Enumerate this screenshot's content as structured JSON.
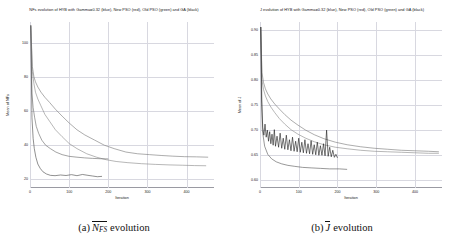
{
  "figure": {
    "panels": [
      {
        "id": "panel-nfs",
        "title": "NFs evolution of HYB with Gamma=0.32 (blue), New PSO (red), Old PSO (green) and GA (black)",
        "caption_lead": "(a)",
        "caption_symbol_main": "N",
        "caption_symbol_sub": "FS",
        "caption_tail": "evolution"
      },
      {
        "id": "panel-j",
        "title": "J evolution of HYB with Gamma=0.32 (blue), New PSO (red), Old PSO (green) and GA (black)",
        "caption_lead": "(b)",
        "caption_symbol_main": "J",
        "caption_symbol_sub": "",
        "caption_tail": "evolution"
      }
    ]
  },
  "chart_data": [
    {
      "type": "line",
      "id": "nfs-evolution",
      "title": "NFs evolution of HYB with Gamma=0.32 (blue), New PSO (red), Old PSO (green) and GA (black)",
      "xlabel": "Iteration",
      "ylabel": "Mean of NFs",
      "xlim": [
        0,
        470
      ],
      "ylim": [
        15,
        112
      ],
      "xticks": [
        0,
        100,
        200,
        300,
        400
      ],
      "yticks": [
        20,
        40,
        60,
        80,
        100
      ],
      "xticklabels": [
        "0",
        "100",
        "200",
        "300",
        "400"
      ],
      "yticklabels": [
        "20",
        "40",
        "60",
        "80",
        "100"
      ],
      "grid": true,
      "legend": "none",
      "series": [
        {
          "name": "Old PSO (green)",
          "color": "#7a7a7a",
          "x": [
            2,
            6,
            10,
            14,
            20,
            28,
            38,
            50,
            65,
            82,
            100,
            120,
            140,
            165,
            190,
            215,
            245,
            275,
            305,
            335,
            365,
            395,
            425,
            455
          ],
          "y": [
            110,
            86,
            80,
            77,
            74,
            71,
            68,
            65,
            61,
            57,
            53,
            49,
            46,
            43,
            40,
            38,
            36,
            35,
            34.5,
            34,
            33.6,
            33.3,
            33.2,
            33.0
          ]
        },
        {
          "name": "New PSO (red)",
          "color": "#8a8a8a",
          "x": [
            2,
            6,
            10,
            14,
            20,
            28,
            38,
            50,
            65,
            82,
            100,
            120,
            145,
            170,
            195,
            220,
            250,
            285,
            320,
            355,
            390,
            420,
            450
          ],
          "y": [
            110,
            83,
            76,
            71,
            67,
            63,
            58,
            54,
            49,
            45,
            41,
            38,
            35,
            33,
            31.5,
            30.5,
            29.8,
            29.2,
            28.8,
            28.5,
            28.3,
            28.1,
            28.0
          ]
        },
        {
          "name": "GA (black)",
          "color": "#6a6a6a",
          "x": [
            2,
            5,
            8,
            12,
            16,
            22,
            30,
            40,
            52,
            66,
            82,
            100,
            120,
            140,
            160,
            180,
            200
          ],
          "y": [
            110,
            70,
            62,
            56,
            51,
            47,
            43,
            40,
            38,
            36,
            34.5,
            33.5,
            33,
            32.6,
            32.3,
            32.1,
            32.0
          ]
        },
        {
          "name": "HYB Gamma=0.32 (blue)",
          "color": "#4a4a4a",
          "x": [
            2,
            5,
            8,
            11,
            15,
            20,
            26,
            33,
            42,
            52,
            64,
            78,
            92,
            106,
            120,
            134,
            148,
            160,
            172,
            184
          ],
          "y": [
            110,
            56,
            44,
            38,
            33,
            29,
            26.5,
            24.5,
            23.2,
            22.4,
            22.2,
            22.6,
            22.3,
            22.8,
            22.2,
            22.9,
            22.4,
            22.0,
            21.6,
            21.8
          ]
        }
      ]
    },
    {
      "type": "line",
      "id": "j-evolution",
      "title": "J evolution of HYB with Gamma=0.32 (blue), New PSO (red), Old PSO (green) and GA (black)",
      "xlabel": "Iteration",
      "ylabel": "Mean of J",
      "xlim": [
        0,
        470
      ],
      "ylim": [
        0.585,
        0.915
      ],
      "xticks": [
        0,
        100,
        200,
        300,
        400
      ],
      "yticks": [
        0.6,
        0.65,
        0.7,
        0.75,
        0.8,
        0.85,
        0.9
      ],
      "xticklabels": [
        "0",
        "100",
        "200",
        "300",
        "400"
      ],
      "yticklabels": [
        "0.60",
        "0.65",
        "0.70",
        "0.75",
        "0.80",
        "0.85",
        "0.90"
      ],
      "grid": true,
      "legend": "none",
      "series": [
        {
          "name": "Old PSO (green)",
          "color": "#7a7a7a",
          "x": [
            2,
            5,
            9,
            14,
            20,
            28,
            38,
            50,
            64,
            80,
            98,
            118,
            140,
            165,
            195,
            225,
            260,
            295,
            330,
            365,
            400,
            435,
            462
          ],
          "y": [
            0.905,
            0.815,
            0.795,
            0.782,
            0.772,
            0.762,
            0.752,
            0.742,
            0.731,
            0.72,
            0.71,
            0.7,
            0.691,
            0.683,
            0.676,
            0.671,
            0.667,
            0.664,
            0.662,
            0.66,
            0.659,
            0.658,
            0.657
          ]
        },
        {
          "name": "New PSO (red)",
          "color": "#8a8a8a",
          "x": [
            2,
            5,
            9,
            14,
            20,
            28,
            38,
            50,
            64,
            80,
            98,
            118,
            140,
            165,
            195,
            225,
            260,
            295,
            330,
            365,
            400,
            435,
            462
          ],
          "y": [
            0.905,
            0.8,
            0.781,
            0.768,
            0.757,
            0.746,
            0.735,
            0.723,
            0.712,
            0.701,
            0.692,
            0.684,
            0.677,
            0.671,
            0.666,
            0.663,
            0.66,
            0.658,
            0.657,
            0.656,
            0.655,
            0.654,
            0.654
          ]
        },
        {
          "name": "HYB Gamma=0.32 (blue)",
          "color": "#5a5a5a",
          "x": [
            2,
            6,
            12,
            20,
            30,
            42,
            56,
            72,
            90,
            110,
            132,
            156,
            180,
            205,
            225
          ],
          "y": [
            0.905,
            0.7,
            0.668,
            0.652,
            0.643,
            0.637,
            0.633,
            0.63,
            0.628,
            0.626,
            0.625,
            0.624,
            0.623,
            0.623,
            0.622
          ]
        },
        {
          "name": "GA (black, noisy)",
          "color": "#1f1f1f",
          "x": [
            2,
            4,
            7,
            10,
            13,
            16,
            19,
            22,
            25,
            28,
            31,
            34,
            37,
            40,
            44,
            48,
            52,
            56,
            60,
            64,
            68,
            72,
            76,
            80,
            84,
            88,
            92,
            96,
            100,
            104,
            108,
            112,
            116,
            120,
            124,
            128,
            132,
            136,
            140,
            144,
            148,
            152,
            156,
            160,
            164,
            168,
            172,
            176,
            180,
            184,
            188,
            192,
            196,
            200
          ],
          "y": [
            0.905,
            0.76,
            0.706,
            0.69,
            0.712,
            0.686,
            0.7,
            0.678,
            0.697,
            0.673,
            0.692,
            0.67,
            0.701,
            0.668,
            0.688,
            0.666,
            0.694,
            0.664,
            0.684,
            0.662,
            0.69,
            0.661,
            0.681,
            0.659,
            0.686,
            0.658,
            0.678,
            0.657,
            0.684,
            0.656,
            0.676,
            0.655,
            0.681,
            0.654,
            0.673,
            0.653,
            0.679,
            0.652,
            0.671,
            0.651,
            0.676,
            0.65,
            0.669,
            0.65,
            0.673,
            0.649,
            0.7,
            0.648,
            0.666,
            0.647,
            0.66,
            0.646,
            0.652,
            0.645
          ]
        }
      ]
    }
  ]
}
